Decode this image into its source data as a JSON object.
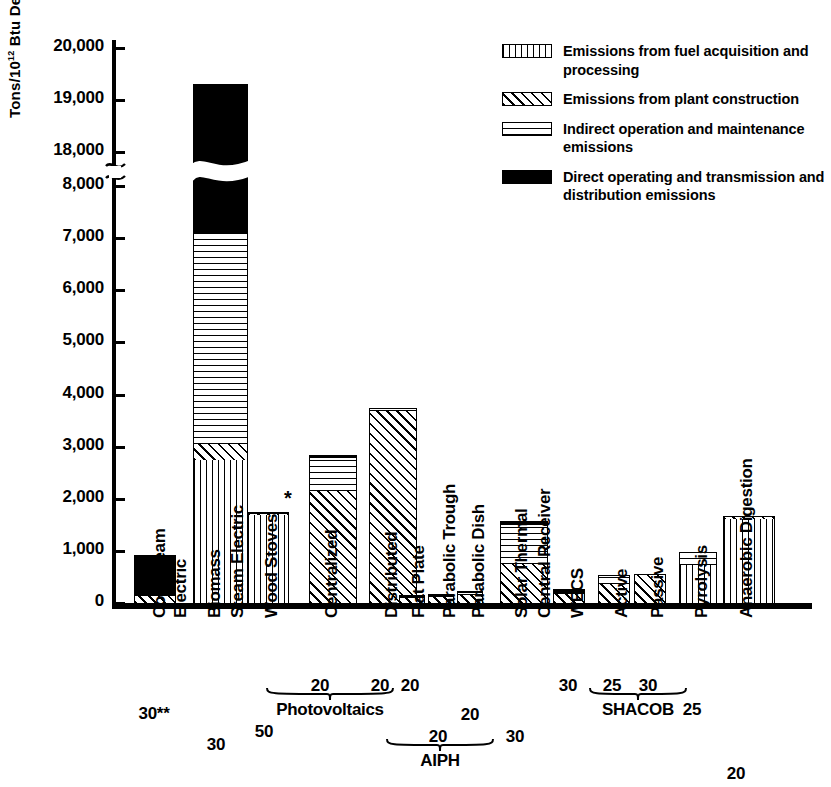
{
  "chart_data": {
    "type": "bar",
    "title": "",
    "xlabel": "",
    "ylabel": "Tons/10¹² Btu Delivered Each Year",
    "ylim": [
      0,
      20000
    ],
    "grid": false,
    "stacked": true,
    "axis_break": {
      "from": 8000,
      "to": 18000,
      "note": "y-axis broken between 8,000 and 18,000"
    },
    "y_ticks": [
      "0",
      "1,000",
      "2,000",
      "3,000",
      "4,000",
      "5,000",
      "6,000",
      "7,000",
      "8,000",
      "18,000",
      "19,000",
      "20,000"
    ],
    "legend_position": "top-right",
    "series": [
      {
        "name": "Emissions from fuel acquisition and processing",
        "pattern": "vertical-lines",
        "values": [
          0,
          2750,
          1700,
          0,
          0,
          0,
          0,
          0,
          0,
          0,
          0,
          0,
          720,
          1610
        ]
      },
      {
        "name": "Emissions from plant construction",
        "pattern": "diagonal-lines",
        "values": [
          130,
          300,
          30,
          2150,
          3690,
          90,
          110,
          150,
          740,
          170,
          370,
          550,
          0,
          60
        ]
      },
      {
        "name": "Indirect operation and maintenance emissions",
        "pattern": "horizontal-lines",
        "values": [
          0,
          4050,
          0,
          630,
          60,
          40,
          40,
          40,
          750,
          0,
          160,
          0,
          250,
          0
        ]
      },
      {
        "name": "Direct operating and transmission and distribution emissions",
        "pattern": "solid-black",
        "values": [
          790,
          12200,
          20,
          50,
          0,
          20,
          30,
          40,
          80,
          100,
          0,
          0,
          0,
          0
        ]
      }
    ],
    "categories": [
      {
        "label": "Coal Steam\nElectric",
        "value": 920,
        "year": "30**"
      },
      {
        "label": "Biomass\nSteam Electric",
        "value": 19300,
        "year": "30"
      },
      {
        "label": "Wood Stoves",
        "value": 1750,
        "year": "50",
        "marker": "*"
      },
      {
        "label": "Centralized",
        "value": 2830,
        "year": "20",
        "group": "Photovoltaics"
      },
      {
        "label": "Distributed",
        "value": 3750,
        "year": "20",
        "group": "Photovoltaics"
      },
      {
        "label": "Flat Plate",
        "value": 150,
        "year": "20",
        "group": "AIPH"
      },
      {
        "label": "Parabolic Trough",
        "value": 180,
        "year": "20",
        "group": "AIPH"
      },
      {
        "label": "Parabolic Dish",
        "value": 230,
        "year": "20",
        "group": "AIPH"
      },
      {
        "label": "Solar Thermal\nCentral Receiver",
        "value": 1570,
        "year": "30"
      },
      {
        "label": "WECS",
        "value": 270,
        "year": "30"
      },
      {
        "label": "Active",
        "value": 530,
        "year": "25",
        "group": "SHACOB"
      },
      {
        "label": "Passive",
        "value": 550,
        "year": "30",
        "group": "SHACOB"
      },
      {
        "label": "Pyrolysis",
        "value": 970,
        "year": "25"
      },
      {
        "label": "Anaerobic Digestion",
        "value": 1670,
        "year": "20"
      }
    ],
    "groups": [
      {
        "name": "Photovoltaics",
        "members": [
          "Centralized",
          "Distributed"
        ]
      },
      {
        "name": "AIPH",
        "members": [
          "Flat Plate",
          "Parabolic Trough",
          "Parabolic Dish"
        ]
      },
      {
        "name": "SHACOB",
        "members": [
          "Active",
          "Passive"
        ]
      }
    ]
  },
  "legend": {
    "items": [
      {
        "label": "Emissions from fuel acquisition and processing",
        "pattern": "vertical-lines"
      },
      {
        "label": "Emissions from plant construction",
        "pattern": "diagonal-lines"
      },
      {
        "label": "Indirect operation and maintenance emissions",
        "pattern": "horizontal-lines"
      },
      {
        "label": "Direct operating and transmission and distribution emissions",
        "pattern": "solid-black"
      }
    ]
  },
  "axis": {
    "y_label": "Tons/10",
    "y_label_sup": "12",
    "y_label_rest": " Btu Delivered Each Year"
  },
  "colors": {
    "ink": "#000000",
    "paper": "#ffffff"
  }
}
